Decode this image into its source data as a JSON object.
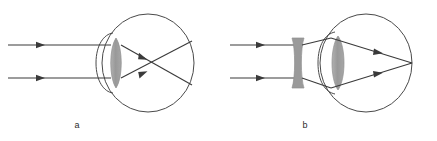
{
  "figure": {
    "background_color": "#ffffff",
    "width": 437,
    "height": 141
  },
  "style": {
    "ray_color": "#3a3a3a",
    "outline_color": "#4a4a4a",
    "lens_fill": "#9a9a9a",
    "lens_stroke": "#8a8a8a",
    "caption_color": "#2b2b2b",
    "ray_stroke_width": 1.1,
    "outline_stroke_width": 1.0
  },
  "panels": [
    {
      "id": "a",
      "caption": "a",
      "caption_x": 77,
      "caption_y": 128,
      "description": "Uncorrected eye: parallel rays converge in front of the retina",
      "eyeball": {
        "cx": 148,
        "cy": 63,
        "rx": 46,
        "ry": 49
      },
      "cornea": {
        "bulge_left_x": 96,
        "top_y": 38,
        "bottom_y": 88
      },
      "crystalline_lens": {
        "type": "biconvex",
        "cx": 116,
        "cy": 63,
        "rx": 7,
        "ry": 25
      },
      "incoming_rays": [
        {
          "x1": 8,
          "y1": 45,
          "x2": 110,
          "y2": 45,
          "arrow_x": 42
        },
        {
          "x1": 8,
          "y1": 78,
          "x2": 110,
          "y2": 78,
          "arrow_x": 42
        }
      ],
      "refracted_rays": [
        {
          "x1": 122,
          "y1": 45,
          "x2": 192,
          "y2": 84,
          "arrow_x": 146,
          "arrow_y": 58
        },
        {
          "x1": 122,
          "y1": 78,
          "x2": 192,
          "y2": 42,
          "arrow_x": 146,
          "arrow_y": 65
        }
      ],
      "focal_point": {
        "x": 161,
        "y": 63,
        "label": "focus in front of retina"
      },
      "corrective_lens": null
    },
    {
      "id": "b",
      "caption": "b",
      "caption_x": 305,
      "caption_y": 128,
      "description": "Corrected eye: a diverging (concave) lens spreads rays so they focus on the retina",
      "eyeball": {
        "cx": 366,
        "cy": 63,
        "rx": 46,
        "ry": 49
      },
      "cornea": {
        "bulge_left_x": 318,
        "top_y": 38,
        "bottom_y": 88
      },
      "crystalline_lens": {
        "type": "biconvex",
        "cx": 338,
        "cy": 63,
        "rx": 8,
        "ry": 27
      },
      "corrective_lens": {
        "type": "biconcave",
        "cx": 298,
        "cy": 63,
        "half_width": 6,
        "top_y": 38,
        "bottom_y": 88,
        "waist_half_width": 2
      },
      "incoming_rays": [
        {
          "x1": 230,
          "y1": 45,
          "x2": 293,
          "y2": 45,
          "arrow_x": 262
        },
        {
          "x1": 230,
          "y1": 78,
          "x2": 293,
          "y2": 78,
          "arrow_x": 262
        }
      ],
      "diverged_rays": [
        {
          "x1": 303,
          "y1": 45,
          "x2": 330,
          "y2": 38
        },
        {
          "x1": 303,
          "y1": 78,
          "x2": 330,
          "y2": 87
        }
      ],
      "refracted_rays": [
        {
          "x1": 330,
          "y1": 38,
          "x2": 412,
          "y2": 63,
          "arrow_x": 382,
          "arrow_y": 54
        },
        {
          "x1": 330,
          "y1": 87,
          "x2": 412,
          "y2": 63,
          "arrow_x": 382,
          "arrow_y": 73
        }
      ],
      "focal_point": {
        "x": 412,
        "y": 63,
        "label": "focus on retina"
      }
    }
  ]
}
